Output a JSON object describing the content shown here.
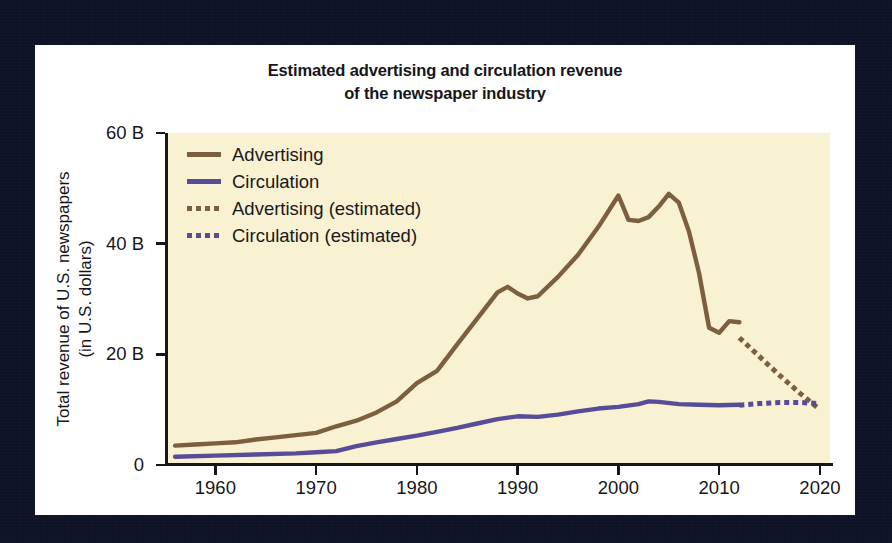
{
  "chart_data": {
    "type": "line",
    "title": "Estimated advertising and circulation revenue of the newspaper industry",
    "title_line1": "Estimated advertising and circulation revenue",
    "title_line2": "of the newspaper industry",
    "xlabel": "",
    "ylabel": "Total revenue of U.S. newspapers (in U.S. dollars)",
    "ylabel_line1": "Total revenue of U.S. newspapers",
    "ylabel_line2": "(in U.S. dollars)",
    "xlim": [
      1955,
      2021
    ],
    "ylim": [
      0,
      60
    ],
    "y_ticks": [
      0,
      20,
      40,
      60
    ],
    "y_tick_labels": [
      "0",
      "20 B",
      "40 B",
      "60 B"
    ],
    "x_ticks": [
      1960,
      1970,
      1980,
      1990,
      2000,
      2010,
      2020
    ],
    "x_tick_labels": [
      "1960",
      "1970",
      "1980",
      "1990",
      "2000",
      "2010",
      "2020"
    ],
    "grid": false,
    "legend_position": "top-left",
    "y_unit": "billions of U.S. dollars",
    "colors": {
      "advertising": "#7d5e3f",
      "circulation": "#574c98",
      "plot_background": "#f8f1d2",
      "card_background": "#ffffff",
      "page_background": "#0d1226",
      "axis": "#17171a",
      "text": "#16161a"
    },
    "series": [
      {
        "name": "Advertising",
        "style": "solid",
        "color": "#7d5e3f",
        "x": [
          1956,
          1958,
          1960,
          1962,
          1964,
          1966,
          1968,
          1970,
          1972,
          1974,
          1976,
          1978,
          1980,
          1982,
          1984,
          1986,
          1988,
          1989,
          1990,
          1991,
          1992,
          1994,
          1996,
          1998,
          2000,
          2001,
          2002,
          2003,
          2004,
          2005,
          2006,
          2007,
          2008,
          2009,
          2010,
          2011,
          2012
        ],
        "values": [
          3.5,
          3.7,
          3.9,
          4.1,
          4.6,
          5.0,
          5.4,
          5.8,
          7.0,
          8.0,
          9.5,
          11.5,
          14.8,
          17.0,
          21.8,
          26.5,
          31.2,
          32.2,
          31.0,
          30.1,
          30.5,
          34.0,
          38.0,
          43.0,
          48.7,
          44.3,
          44.1,
          44.8,
          46.7,
          49.0,
          47.4,
          42.2,
          34.7,
          24.8,
          23.9,
          26.0,
          25.8
        ]
      },
      {
        "name": "Circulation",
        "style": "solid",
        "color": "#574c98",
        "x": [
          1956,
          1960,
          1964,
          1968,
          1970,
          1972,
          1974,
          1976,
          1978,
          1980,
          1982,
          1984,
          1986,
          1988,
          1990,
          1992,
          1994,
          1996,
          1998,
          2000,
          2002,
          2003,
          2004,
          2006,
          2008,
          2010,
          2012
        ],
        "values": [
          1.5,
          1.7,
          1.9,
          2.1,
          2.3,
          2.5,
          3.4,
          4.1,
          4.7,
          5.3,
          6.0,
          6.7,
          7.5,
          8.3,
          8.8,
          8.7,
          9.1,
          9.7,
          10.2,
          10.5,
          11.0,
          11.5,
          11.4,
          11.0,
          10.9,
          10.8,
          10.9
        ]
      },
      {
        "name": "Advertising (estimated)",
        "style": "dotted",
        "color": "#7d5e3f",
        "x": [
          2012,
          2014,
          2016,
          2018,
          2020
        ],
        "values": [
          23.0,
          19.6,
          16.2,
          13.0,
          10.0
        ]
      },
      {
        "name": "Circulation (estimated)",
        "style": "dotted",
        "color": "#574c98",
        "x": [
          2012,
          2014,
          2016,
          2018,
          2020
        ],
        "values": [
          10.8,
          11.1,
          11.3,
          11.3,
          11.1
        ]
      }
    ]
  },
  "legend": {
    "items": [
      {
        "label": "Advertising",
        "color": "#7d5e3f",
        "style": "solid"
      },
      {
        "label": "Circulation",
        "color": "#574c98",
        "style": "solid"
      },
      {
        "label": "Advertising (estimated)",
        "color": "#7d5e3f",
        "style": "dotted"
      },
      {
        "label": "Circulation (estimated)",
        "color": "#574c98",
        "style": "dotted"
      }
    ]
  }
}
